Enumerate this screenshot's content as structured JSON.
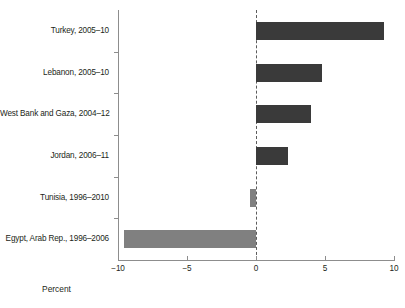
{
  "chart_data": {
    "type": "bar",
    "orientation": "horizontal",
    "title": "",
    "xlabel": "Percent",
    "ylabel": "",
    "xlim": [
      -10,
      10
    ],
    "xticks": [
      -10,
      -5,
      0,
      5,
      10
    ],
    "xtick_labels": [
      "−10",
      "−5",
      "0",
      "5",
      "10"
    ],
    "grid": false,
    "legend": "none",
    "zero_line": "dashed",
    "categories": [
      "Turkey, 2005–10",
      "Lebanon, 2005–10",
      "West Bank and Gaza, 2004–12",
      "Jordan, 2006–11",
      "Tunisia, 1996–2010",
      "Egypt, Arab Rep., 1996–2006"
    ],
    "values": [
      9.3,
      4.8,
      4.0,
      2.3,
      -0.45,
      -9.6
    ],
    "bar_colors": [
      "#3a3a3a",
      "#3a3a3a",
      "#3a3a3a",
      "#3a3a3a",
      "#808080",
      "#808080"
    ]
  },
  "style": {
    "positive_color": "#3a3a3a",
    "negative_color": "#808080",
    "axis_color": "#8d8d8d",
    "zero_line_color": "#5c5c5c",
    "text_color": "#231f20",
    "background": "#ffffff"
  }
}
